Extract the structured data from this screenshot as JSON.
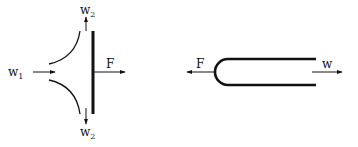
{
  "figures": {
    "left": {
      "description": "Jet impinging on a flat plate, splitting into two streams",
      "labels": {
        "inflow": "w",
        "inflow_sub": "1",
        "outflow_top": "w",
        "outflow_top_sub": "2",
        "outflow_bottom": "w",
        "outflow_bottom_sub": "2",
        "force": "F"
      }
    },
    "right": {
      "description": "Flow through U-bend (180° return)",
      "labels": {
        "force": "F",
        "flow": "w"
      }
    }
  },
  "colors": {
    "stroke": "#111111",
    "background": "#ffffff"
  }
}
